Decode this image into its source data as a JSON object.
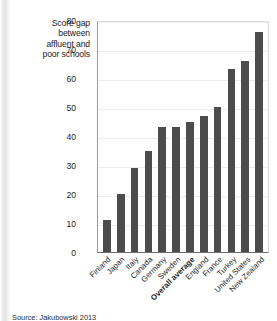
{
  "figure": {
    "axis_title": "Score gap between affluent and poor schools",
    "axis_title_lines": [
      "Score gap",
      "between",
      "affluent and",
      "poor schools"
    ],
    "source_note": "Source: Jakubowski 2013",
    "bar_color": "#4c4c4c",
    "gridline_color": "#ececec",
    "axis_color": "#6d6d6d"
  },
  "chart_data": {
    "type": "bar",
    "title": "",
    "subtitle": "",
    "xlabel": "",
    "ylabel": "Score gap between affluent and poor schools",
    "ylim": [
      0,
      80
    ],
    "yticks": [
      0,
      10,
      20,
      30,
      40,
      50,
      60,
      70,
      80
    ],
    "ytick_labels": [
      "0",
      "10",
      "20",
      "30",
      "40",
      "50",
      "60",
      "70",
      "80"
    ],
    "grid": true,
    "legend": false,
    "legend_position": "none",
    "orientation": "vertical",
    "categories": [
      "Finland",
      "Japan",
      "Italy",
      "Canada",
      "Germany",
      "Sweden",
      "Overall average",
      "England",
      "France",
      "Turkey",
      "United States",
      "New Zealand"
    ],
    "highlighted_categories": [
      "Overall average"
    ],
    "values": [
      11,
      20,
      29,
      35,
      43,
      43,
      45,
      47,
      50,
      63,
      66,
      76
    ],
    "series": [
      {
        "name": "Score gap",
        "values": [
          11,
          20,
          29,
          35,
          43,
          43,
          45,
          47,
          50,
          63,
          66,
          76
        ]
      }
    ]
  }
}
